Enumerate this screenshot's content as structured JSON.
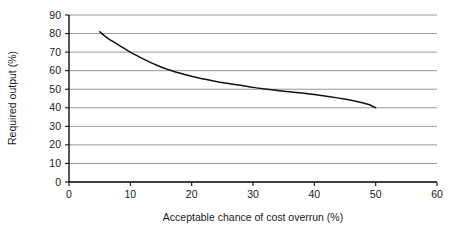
{
  "chart_data": {
    "type": "line",
    "title": "",
    "xlabel": "Acceptable chance of cost overrun (%)",
    "ylabel": "Required output (%)",
    "xlim": [
      0,
      60
    ],
    "ylim": [
      0,
      90
    ],
    "xticks": [
      "0",
      "10",
      "20",
      "30",
      "40",
      "50",
      "60"
    ],
    "xtick_values": [
      0,
      10,
      20,
      30,
      40,
      50,
      60
    ],
    "yticks": [
      "0",
      "10",
      "20",
      "30",
      "40",
      "50",
      "60",
      "70",
      "80",
      "90"
    ],
    "ytick_values": [
      0,
      10,
      20,
      30,
      40,
      50,
      60,
      70,
      80,
      90
    ],
    "grid": "horizontal",
    "legend": "none",
    "series": [
      {
        "name": "Required output vs acceptable chance of cost overrun",
        "color": "#111111",
        "x": [
          5,
          6,
          7,
          8,
          9,
          10,
          11,
          12,
          13,
          14,
          15,
          16,
          17,
          18,
          19,
          20,
          22,
          24,
          26,
          28,
          30,
          32,
          34,
          36,
          38,
          40,
          42,
          44,
          46,
          48,
          49,
          50
        ],
        "y": [
          81.0,
          78.2,
          76.0,
          74.0,
          72.0,
          70.0,
          68.2,
          66.5,
          64.9,
          63.4,
          62.0,
          60.8,
          59.7,
          58.7,
          57.8,
          57.0,
          55.5,
          54.2,
          53.1,
          52.1,
          51.0,
          50.1,
          49.3,
          48.6,
          47.9,
          47.1,
          46.2,
          45.2,
          44.1,
          42.6,
          41.6,
          40.0
        ]
      }
    ]
  },
  "colors": {
    "grid": "#8c8c8c",
    "axis": "#111111",
    "curve": "#111111",
    "background": "#ffffff"
  }
}
